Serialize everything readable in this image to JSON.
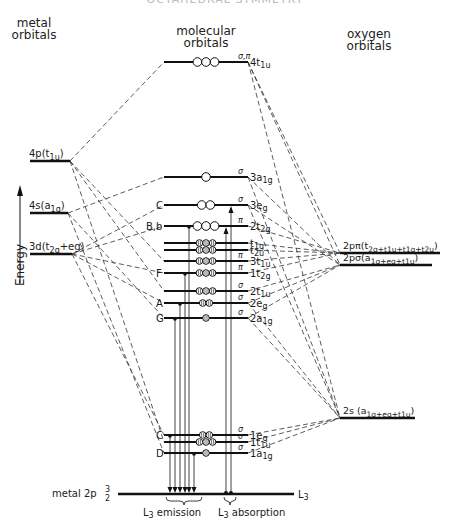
{
  "title": "OCTAHEDRAL SYMMETRY",
  "headers": {
    "metal": [
      "metal",
      "orbitals"
    ],
    "molecular": [
      "molecular",
      "orbitals"
    ],
    "oxygen": [
      "oxygen",
      "orbitals"
    ]
  },
  "axis": {
    "label": "Energy"
  },
  "metal_levels": [
    {
      "id": "4p",
      "label": "4p(t1u)",
      "main": "4p(t",
      "sub": "1u",
      "tail": ")",
      "y": 161,
      "x1": 30,
      "x2": 70
    },
    {
      "id": "4s",
      "label": "4s(a1g)",
      "main": "4s(a",
      "sub": "1g",
      "tail": ")",
      "y": 213,
      "x1": 30,
      "x2": 68
    },
    {
      "id": "3d",
      "label": "3d(t2g+eg)",
      "main": "3d(t",
      "sub": "2g",
      "tail": "+eg)",
      "y": 254,
      "x1": 30,
      "x2": 72
    }
  ],
  "mo_levels": [
    {
      "id": "4t1u",
      "label": "4t1u",
      "sym": "σ,π",
      "left": "",
      "y": 62,
      "x1": 164,
      "x2": 248,
      "occ": "ooo",
      "filled": false
    },
    {
      "id": "3a1g",
      "label": "3a1g",
      "sym": "σ",
      "left": "",
      "y": 177,
      "x1": 164,
      "x2": 248,
      "occ": "o",
      "filled": false
    },
    {
      "id": "3eg",
      "label": "3eg",
      "sym": "σ",
      "left": "C",
      "y": 205,
      "x1": 164,
      "x2": 248,
      "occ": "oo",
      "filled": false
    },
    {
      "id": "2t2g",
      "label": "2t2g",
      "sym": "π",
      "left": "B,b",
      "y": 226,
      "x1": 164,
      "x2": 248,
      "occ": "ooo",
      "filled": false
    },
    {
      "id": "t1g",
      "label": "t1g",
      "sym": "",
      "left": "",
      "y": 243,
      "x1": 164,
      "x2": 248,
      "occ": "ooo",
      "filled": true
    },
    {
      "id": "t2u",
      "label": "t2u",
      "sym": "",
      "left": "",
      "y": 250,
      "x1": 164,
      "x2": 248,
      "occ": "ooo",
      "filled": true
    },
    {
      "id": "3t1u",
      "label": "3t1u",
      "sym": "π",
      "left": "",
      "y": 261,
      "x1": 164,
      "x2": 248,
      "occ": "ooo",
      "filled": true
    },
    {
      "id": "1t2g",
      "label": "1t2g",
      "sym": "π",
      "left": "F",
      "y": 273,
      "x1": 164,
      "x2": 248,
      "occ": "ooo",
      "filled": true
    },
    {
      "id": "2t1u",
      "label": "2t1u",
      "sym": "σ",
      "left": "",
      "y": 291,
      "x1": 164,
      "x2": 248,
      "occ": "ooo",
      "filled": true
    },
    {
      "id": "2eg",
      "label": "2eg",
      "sym": "σ",
      "left": "A",
      "y": 303,
      "x1": 164,
      "x2": 248,
      "occ": "oo",
      "filled": true
    },
    {
      "id": "2a1g",
      "label": "2a1g",
      "sym": "σ",
      "left": "G",
      "y": 318,
      "x1": 164,
      "x2": 248,
      "occ": "o",
      "filled": true
    },
    {
      "id": "1eg",
      "label": "1eg",
      "sym": "σ",
      "left": "C",
      "y": 435,
      "x1": 164,
      "x2": 248,
      "occ": "oo",
      "filled": true
    },
    {
      "id": "1t1u",
      "label": "1t1u",
      "sym": "σ",
      "left": "",
      "y": 442,
      "x1": 164,
      "x2": 248,
      "occ": "ooo",
      "filled": true
    },
    {
      "id": "1a1g",
      "label": "1a1g",
      "sym": "σ",
      "left": "D",
      "y": 453,
      "x1": 164,
      "x2": 248,
      "occ": "o",
      "filled": true
    }
  ],
  "oxygen_levels": [
    {
      "id": "2ppi",
      "label": "2pπ(t2g+t1u+t1g+t2u)",
      "main": "2pπ(t",
      "subs": "2g+t1u+t1g+t2u",
      "y": 253,
      "x1": 340,
      "x2": 440
    },
    {
      "id": "2psig",
      "label": "2pσ(a1g+eg+t1u)",
      "main": "2pσ(a",
      "subs": "1g+eg+t1u",
      "y": 265,
      "x1": 340,
      "x2": 432
    },
    {
      "id": "2s",
      "label": "2s(a1g+eg+t1u)",
      "main": "2s (a",
      "subs": "1g+eg+t1u",
      "y": 418,
      "x1": 340,
      "x2": 415
    }
  ],
  "core_level": {
    "label": "metal 2p3/2",
    "main": "metal 2p",
    "frac_num": "3",
    "frac_den": "2",
    "right_label": "L3",
    "y": 494,
    "x1": 118,
    "x2": 294
  },
  "bottom_labels": {
    "emission": "L3 emission",
    "absorption": "L3 absorption"
  },
  "letters": {
    "B_lower": "B"
  },
  "colors": {
    "line": "#111111",
    "dash": "#333333",
    "background": "#ffffff"
  }
}
